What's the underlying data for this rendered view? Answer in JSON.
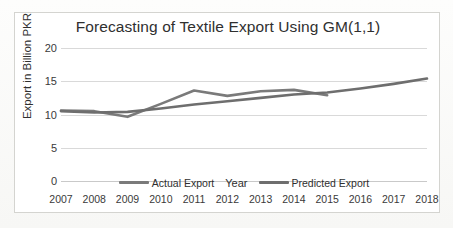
{
  "chart_data": {
    "type": "line",
    "title": "Forecasting of Textile Export Using GM(1,1)",
    "xlabel": "Year",
    "ylabel": "Export in Billion PKR",
    "categories": [
      "2007",
      "2008",
      "2009",
      "2010",
      "2011",
      "2012",
      "2013",
      "2014",
      "2015",
      "2016",
      "2017",
      "2018"
    ],
    "x": [
      2007,
      2008,
      2009,
      2010,
      2011,
      2012,
      2013,
      2014,
      2015,
      2016,
      2017,
      2018
    ],
    "ylim": [
      0,
      20
    ],
    "yticks": [
      "0",
      "5",
      "10",
      "15",
      "20"
    ],
    "ytick_values": [
      0,
      5,
      10,
      15,
      20
    ],
    "grid": true,
    "legend_position": "bottom",
    "series": [
      {
        "name": "Actual Export",
        "color": "#7a7a7a",
        "values": [
          10.6,
          10.5,
          9.65,
          11.6,
          13.6,
          12.8,
          13.5,
          13.7,
          12.9,
          null,
          null,
          null
        ]
      },
      {
        "name": "Predicted Export",
        "color": "#6e6e6e",
        "values": [
          10.5,
          10.3,
          10.4,
          10.9,
          11.5,
          12.0,
          12.5,
          13.0,
          13.3,
          13.9,
          14.6,
          15.4
        ]
      }
    ]
  },
  "chart": {
    "title": "Forecasting of Textile Export Using GM(1,1)",
    "yaxis_title": "Export in Billion PKR",
    "xaxis_title": "Year",
    "ytick_labels": [
      "20",
      "15",
      "10",
      "5",
      "0"
    ],
    "xtick_labels": [
      "2007",
      "2008",
      "2009",
      "2010",
      "2011",
      "2012",
      "2013",
      "2014",
      "2015",
      "2016",
      "2017",
      "2018"
    ],
    "legend": [
      {
        "label": "Actual Export",
        "color": "#7a7a7a"
      },
      {
        "label": "Predicted Export",
        "color": "#6e6e6e"
      }
    ],
    "colors": {
      "plot_background": "#ffffff",
      "page_background": "#fbfbfa",
      "border": "#d4d4d0",
      "gridline": "#d9d9d9",
      "text": "#2f2f2f"
    }
  }
}
